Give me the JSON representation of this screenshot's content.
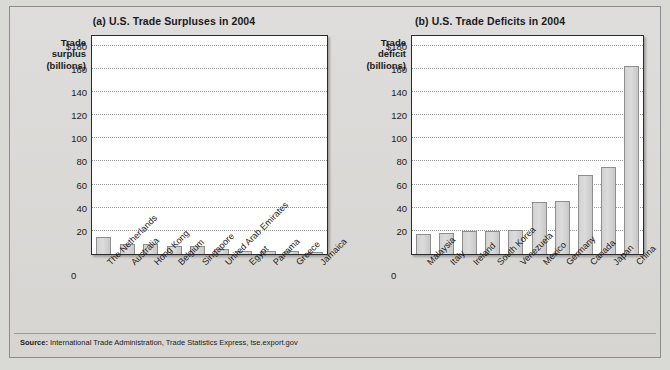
{
  "figure": {
    "source_prefix": "Source:",
    "source_text": " International Trade Administration, Trade Statistics Express, tse.export.gov"
  },
  "panel_a": {
    "title": "(a) U.S. Trade Surpluses in 2004",
    "axis_caption": "Trade\nsurplus\n(billions)",
    "axis_caption_line1": "Trade",
    "axis_caption_line2": "surplus",
    "axis_caption_line3": "(billions)",
    "zero_label": "0",
    "ticks": [
      "$180",
      "160",
      "140",
      "120",
      "100",
      "80",
      "60",
      "40",
      "20"
    ]
  },
  "panel_b": {
    "title": "(b) U.S. Trade Deficits in 2004",
    "axis_caption_line1": "Trade",
    "axis_caption_line2": "deficit",
    "axis_caption_line3": "(billions)",
    "zero_label": "0",
    "ticks": [
      "$180",
      "160",
      "140",
      "120",
      "100",
      "80",
      "60",
      "40",
      "20"
    ]
  },
  "chart_data": [
    {
      "type": "bar",
      "title": "(a) U.S. Trade Surpluses in 2004",
      "xlabel": "",
      "ylabel": "Trade surplus (billions)",
      "ylim": [
        0,
        190
      ],
      "yticks": [
        0,
        20,
        40,
        60,
        80,
        100,
        120,
        140,
        160,
        180
      ],
      "ytick_labels": [
        "0",
        "20",
        "40",
        "60",
        "80",
        "100",
        "120",
        "140",
        "160",
        "$180"
      ],
      "grid": true,
      "legend": "none",
      "categories": [
        "The Netherlands",
        "Australia",
        "Hong Kong",
        "Belgium",
        "Singapore",
        "United Arab Emirates",
        "Egypt",
        "Panama",
        "Greece",
        "Jamaica"
      ],
      "values": [
        15.0,
        9.0,
        8.5,
        6.5,
        6.5,
        4.5,
        3.0,
        2.5,
        2.5,
        2.0
      ]
    },
    {
      "type": "bar",
      "title": "(b) U.S. Trade Deficits in 2004",
      "xlabel": "",
      "ylabel": "Trade deficit (billions)",
      "ylim": [
        0,
        190
      ],
      "yticks": [
        0,
        20,
        40,
        60,
        80,
        100,
        120,
        140,
        160,
        180
      ],
      "ytick_labels": [
        "0",
        "20",
        "40",
        "60",
        "80",
        "100",
        "120",
        "140",
        "160",
        "$180"
      ],
      "grid": true,
      "legend": "none",
      "categories": [
        "Malaysia",
        "Italy",
        "Ireland",
        "South Korea",
        "Venezuela",
        "Mexico",
        "Germany",
        "Canada",
        "Japan",
        "China"
      ],
      "values": [
        17.0,
        18.0,
        19.5,
        20.0,
        21.0,
        45.0,
        46.0,
        68.0,
        75.5,
        162.0
      ]
    }
  ]
}
